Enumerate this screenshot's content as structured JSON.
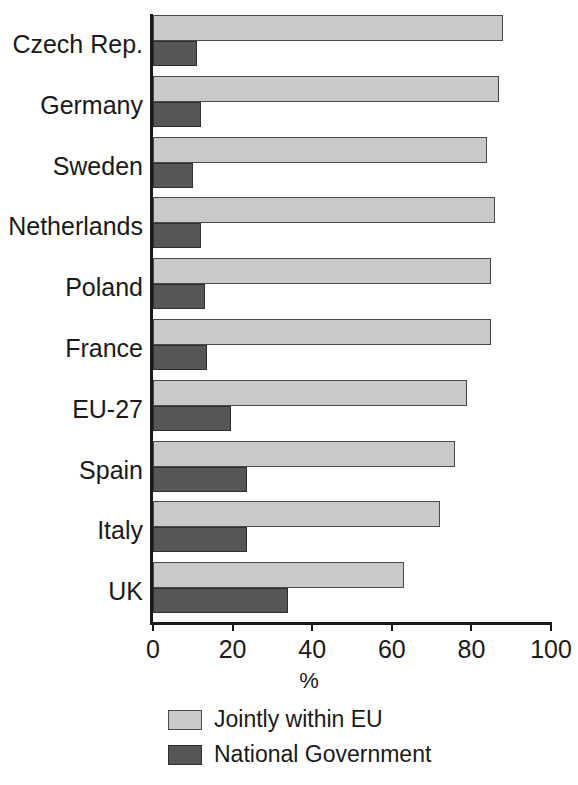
{
  "chart_data": {
    "type": "bar",
    "orientation": "horizontal",
    "title": "",
    "xlabel": "%",
    "ylabel": "",
    "xlim": [
      0,
      100
    ],
    "xticks": [
      0,
      20,
      40,
      60,
      80,
      100
    ],
    "grid": false,
    "legend_position": "bottom",
    "categories": [
      "Czech Rep.",
      "Germany",
      "Sweden",
      "Netherlands",
      "Poland",
      "France",
      "EU-27",
      "Spain",
      "Italy",
      "UK"
    ],
    "series": [
      {
        "name": "Jointly within EU",
        "color": "#c9c9c9",
        "values": [
          88,
          87,
          84,
          86,
          85,
          85,
          79,
          76,
          72,
          63
        ]
      },
      {
        "name": "National Government",
        "color": "#565656",
        "values": [
          11,
          12,
          10,
          12,
          13,
          13.5,
          19.5,
          23.5,
          23.5,
          34
        ]
      }
    ]
  },
  "legend": {
    "items": [
      {
        "label": "Jointly within EU",
        "swatch": "joint"
      },
      {
        "label": "National Government",
        "swatch": "national"
      }
    ]
  },
  "axis": {
    "x_title": "%",
    "tick_labels": [
      "0",
      "20",
      "40",
      "60",
      "80",
      "100"
    ]
  }
}
